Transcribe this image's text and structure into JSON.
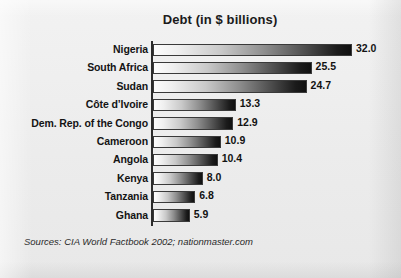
{
  "chart_data": {
    "type": "bar",
    "orientation": "horizontal",
    "title": "Debt (in $ billions)",
    "xlabel": "",
    "ylabel": "",
    "xlim": [
      0,
      32.0
    ],
    "grid": false,
    "legend": null,
    "categories": [
      "Nigeria",
      "South Africa",
      "Sudan",
      "Côte d’Ivoire",
      "Dem. Rep. of the Congo",
      "Cameroon",
      "Angola",
      "Kenya",
      "Tanzania",
      "Ghana"
    ],
    "values": [
      32.0,
      25.5,
      24.7,
      13.3,
      12.9,
      10.9,
      10.4,
      8.0,
      6.8,
      5.9
    ],
    "value_labels": [
      "32.0",
      "25.5",
      "24.7",
      "13.3",
      "12.9",
      "10.9",
      "10.4",
      "8.0",
      "6.8",
      "5.9"
    ],
    "bar_style": "white-to-black horizontal gradient with dark outline"
  },
  "footer": {
    "source_prefix": "Sources: CIA World Factbook 2002;",
    "source_suffix": " nationmaster.com"
  },
  "colors": {
    "background": "#efefef",
    "text": "#141414",
    "axis": "#2b2b2b",
    "bar_light": "#fdfdfd",
    "bar_dark": "#101010"
  }
}
